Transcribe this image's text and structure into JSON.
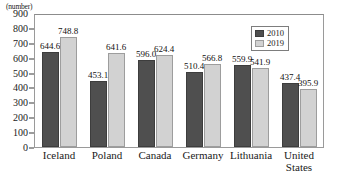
{
  "chart_data": {
    "type": "bar",
    "title": "",
    "xlabel": "",
    "ylabel": "(number)",
    "ylim": [
      0,
      900
    ],
    "ytick_step": 100,
    "yticks": [
      0,
      100,
      200,
      300,
      400,
      500,
      600,
      700,
      800,
      900
    ],
    "grid": false,
    "legend_position": "top-right",
    "categories": [
      "Iceland",
      "Poland",
      "Canada",
      "Germany",
      "Lithuania",
      "United\nStates"
    ],
    "series": [
      {
        "name": "2010",
        "color": "#4f4f4f",
        "values": [
          644.6,
          453.1,
          596.0,
          510.4,
          559.9,
          437.4
        ],
        "labels": [
          "644.6",
          "453.1",
          "596.0",
          "510.4",
          "559.9",
          "437.4"
        ]
      },
      {
        "name": "2019",
        "color": "#d2d2d2",
        "values": [
          748.8,
          641.6,
          624.4,
          566.8,
          541.9,
          395.9
        ],
        "labels": [
          "748.8",
          "641.6",
          "624.4",
          "566.8",
          "541.9",
          "395.9"
        ]
      }
    ]
  },
  "axis": {
    "unit_caption": "(number)",
    "tick_labels": [
      "900",
      "800",
      "700",
      "600",
      "500",
      "400",
      "300",
      "200",
      "100",
      "0"
    ]
  },
  "legend": {
    "items": [
      {
        "label": "2010"
      },
      {
        "label": "2019"
      }
    ]
  }
}
